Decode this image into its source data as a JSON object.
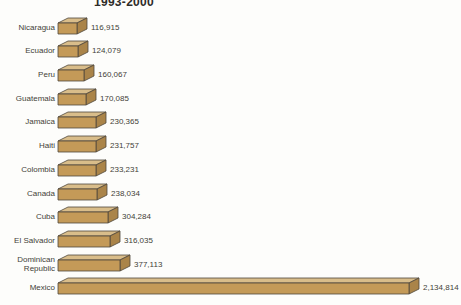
{
  "chart_data": {
    "type": "bar",
    "orientation": "horizontal",
    "title": "1993-2000",
    "categories": [
      "Nicaragua",
      "Ecuador",
      "Peru",
      "Guatemala",
      "Jamaica",
      "Haiti",
      "Colombia",
      "Canada",
      "Cuba",
      "El Salvador",
      "Dominican Republic",
      "Mexico"
    ],
    "values": [
      116915,
      124079,
      160067,
      170085,
      230365,
      231757,
      233231,
      238034,
      304284,
      316035,
      377113,
      2134814
    ],
    "value_labels": [
      "116,915",
      "124,079",
      "160,067",
      "170,085",
      "230,365",
      "231,757",
      "233,231",
      "238,034",
      "304,284",
      "316,035",
      "377,113",
      "2,134,814"
    ],
    "xlim": [
      0,
      2200000
    ],
    "grid": false,
    "legend": "none",
    "bar_style": "3d-box",
    "bar_front_color": "#c49a58",
    "bar_top_color": "#d9bd8a",
    "bar_side_color": "#aa8449",
    "bar_outline_color": "#4f483c",
    "text_color": "#433f38",
    "background_color": "#fdfdfb"
  }
}
